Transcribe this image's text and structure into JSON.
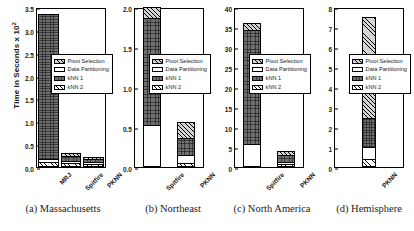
{
  "axis": {
    "ylabel_text": "Time in Seconds x 10",
    "ylabel_exp": "2"
  },
  "legend": {
    "items": [
      {
        "label": "Pivot Selection",
        "key": "pivot"
      },
      {
        "label": "Data Partitioning",
        "key": "part"
      },
      {
        "label": "kNN 1",
        "key": "knn1"
      },
      {
        "label": "kNN 2",
        "key": "knn2"
      }
    ]
  },
  "captions": [
    "(a) Massachusetts",
    "(b) Northeast",
    "(c) North America",
    "(d) Hemisphere"
  ],
  "chart_data": [
    {
      "type": "bar",
      "title": "(a) Massachusetts",
      "stacked": true,
      "xlabel": "",
      "ylabel": "Time in Seconds x 10^2",
      "ylim": [
        0,
        3.5
      ],
      "yticks": [
        "0.0",
        "0.5",
        "1.0",
        "1.5",
        "2.0",
        "2.5",
        "3.0",
        "3.5"
      ],
      "ytick_values": [
        0,
        0.5,
        1.0,
        1.5,
        2.0,
        2.5,
        3.0,
        3.5
      ],
      "grid": false,
      "legend_position": "center-right",
      "categories": [
        "MRJ",
        "Spitfire",
        "PKNN"
      ],
      "series": [
        {
          "name": "kNN 2",
          "values": [
            0.07,
            0.04,
            0.04
          ]
        },
        {
          "name": "Data Partitioning",
          "values": [
            0.06,
            0.06,
            0.05
          ]
        },
        {
          "name": "kNN 1",
          "values": [
            3.22,
            0.12,
            0.08
          ]
        },
        {
          "name": "Pivot Selection",
          "values": [
            0.0,
            0.09,
            0.06
          ]
        }
      ],
      "totals": [
        3.35,
        0.31,
        0.23
      ]
    },
    {
      "type": "bar",
      "title": "(b) Northeast",
      "stacked": true,
      "xlabel": "",
      "ylabel": "",
      "ylim": [
        0,
        2.0
      ],
      "yticks": [
        "0.0",
        "0.5",
        "1.0",
        "1.5",
        "2.0"
      ],
      "ytick_values": [
        0,
        0.5,
        1.0,
        1.5,
        2.0
      ],
      "grid": false,
      "legend_position": "center-right",
      "categories": [
        "Spitfire",
        "PKNN"
      ],
      "series": [
        {
          "name": "kNN 2",
          "values": [
            0.0,
            0.03
          ]
        },
        {
          "name": "Data Partitioning",
          "values": [
            0.51,
            0.1
          ]
        },
        {
          "name": "kNN 1",
          "values": [
            1.35,
            0.22
          ]
        },
        {
          "name": "Pivot Selection",
          "values": [
            0.14,
            0.21
          ]
        }
      ],
      "totals": [
        2.0,
        0.56
      ]
    },
    {
      "type": "bar",
      "title": "(c) North America",
      "stacked": true,
      "xlabel": "",
      "ylabel": "",
      "ylim": [
        0,
        40
      ],
      "yticks": [
        "0",
        "5",
        "10",
        "15",
        "20",
        "25",
        "30",
        "35",
        "40"
      ],
      "ytick_values": [
        0,
        5,
        10,
        15,
        20,
        25,
        30,
        35,
        40
      ],
      "grid": false,
      "legend_position": "center-right",
      "categories": [
        "Spitfire",
        "PKNN"
      ],
      "series": [
        {
          "name": "kNN 2",
          "values": [
            0.0,
            0.3
          ]
        },
        {
          "name": "Data Partitioning",
          "values": [
            5.3,
            0.5
          ]
        },
        {
          "name": "kNN 1",
          "values": [
            29.0,
            2.0
          ]
        },
        {
          "name": "Pivot Selection",
          "values": [
            1.7,
            1.2
          ]
        }
      ],
      "totals": [
        36.0,
        4.0
      ]
    },
    {
      "type": "bar",
      "title": "(d) Hemisphere",
      "stacked": true,
      "xlabel": "",
      "ylabel": "",
      "ylim": [
        0,
        8
      ],
      "yticks": [
        "0",
        "1",
        "2",
        "3",
        "4",
        "5",
        "6",
        "7",
        "8"
      ],
      "ytick_values": [
        0,
        1,
        2,
        3,
        4,
        5,
        6,
        7,
        8
      ],
      "grid": false,
      "legend_position": "center-right",
      "categories": [
        "PKNN"
      ],
      "series": [
        {
          "name": "kNN 2",
          "values": [
            0.3
          ]
        },
        {
          "name": "Data Partitioning",
          "values": [
            0.6
          ]
        },
        {
          "name": "kNN 1",
          "values": [
            1.5
          ]
        },
        {
          "name": "Pivot Selection",
          "values": [
            5.1
          ]
        }
      ],
      "totals": [
        7.5
      ]
    }
  ]
}
